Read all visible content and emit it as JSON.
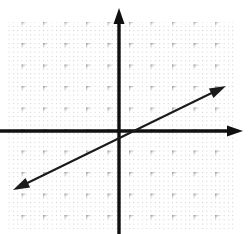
{
  "figure": {
    "title": "",
    "width": 249,
    "height": 234,
    "background_color": "#ffffff"
  },
  "grid": {
    "minor_dot_color": "#c9c9c9",
    "major_dot_color": "#9a9a9a",
    "minor_spacing_px": 4.3,
    "major_spacing_px": 21.5,
    "left_px": 8,
    "top_px": 22,
    "right_px": 236,
    "bottom_px": 229,
    "visible": true
  },
  "axes": {
    "color": "#101010",
    "stroke_width_px": 3,
    "origin_px": {
      "x": 120,
      "y": 131
    },
    "x_axis": {
      "name": "x-axis",
      "from_px": {
        "x": 0,
        "y": 131
      },
      "to_px": {
        "x": 243,
        "y": 131
      },
      "arrow_right": true,
      "arrow_left": false
    },
    "y_axis": {
      "name": "y-axis",
      "from_px": {
        "x": 119,
        "y": 234
      },
      "to_px": {
        "x": 119,
        "y": 8
      },
      "arrow_up": true,
      "arrow_down": false
    },
    "tick_labels": [],
    "axis_labels": {
      "x": "",
      "y": ""
    }
  },
  "chart_data": {
    "type": "line",
    "title": "",
    "xlabel": "",
    "ylabel": "",
    "grid": true,
    "legend": null,
    "xlim": [
      -5.2,
      5.7
    ],
    "ylim": [
      -4.8,
      5.7
    ],
    "unit_px": 21.5,
    "series": [
      {
        "name": "line-1",
        "equation": "y = 0.5x",
        "slope": 0.5,
        "intercept": 0,
        "color": "#1a1a1a",
        "stroke_width_px": 2,
        "arrow_start": true,
        "arrow_end": true,
        "endpoints_px": [
          {
            "x": 13,
            "y": 190
          },
          {
            "x": 226,
            "y": 86
          }
        ],
        "points": [
          {
            "x": -5.0,
            "y": -2.5
          },
          {
            "x": 0,
            "y": 0
          },
          {
            "x": 4.9,
            "y": 2.45
          }
        ]
      }
    ],
    "annotations": []
  }
}
